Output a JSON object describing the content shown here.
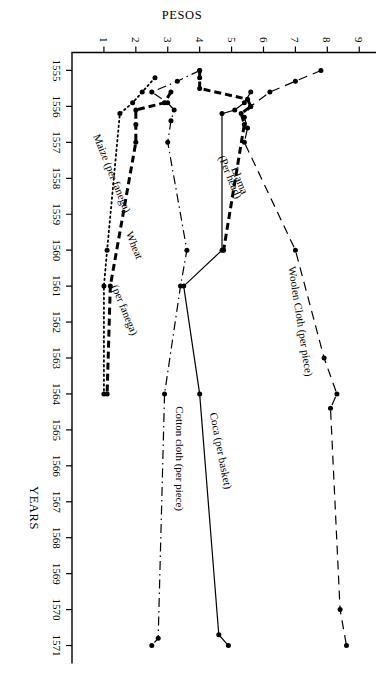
{
  "figure": {
    "x_axis_title": "YEARS",
    "y_axis_title": "PESOS",
    "rotation_note": "landscape plate printed rotated 90 degrees"
  },
  "chart_data": {
    "type": "line",
    "title": "",
    "subtitle": "",
    "xlabel": "YEARS",
    "ylabel": "PESOS",
    "xlim": [
      1554.5,
      1571.5
    ],
    "ylim": [
      0,
      9.4
    ],
    "grid": false,
    "legend": "inline-labels",
    "x_ticks": [
      1555,
      1556,
      1557,
      1558,
      1559,
      1560,
      1561,
      1562,
      1563,
      1564,
      1565,
      1566,
      1567,
      1568,
      1569,
      1570,
      1571
    ],
    "x_tick_labels": [
      "1555",
      "1556",
      "1557",
      "1558",
      "1559",
      "1560",
      "1561",
      "1562",
      "1563",
      "1564",
      "1565",
      "1566",
      "1567",
      "1568",
      "1569",
      "1570",
      "1571"
    ],
    "y_ticks": [
      1,
      2,
      3,
      4,
      5,
      6,
      7,
      8,
      9
    ],
    "y_tick_labels": [
      "1",
      "2",
      "3",
      "4",
      "5",
      "6",
      "7",
      "8",
      "9"
    ],
    "categories": [
      1555,
      1556,
      1557,
      1558,
      1559,
      1560,
      1561,
      1562,
      1563,
      1564,
      1565,
      1566,
      1567,
      1568,
      1569,
      1570,
      1571
    ],
    "series": [
      {
        "name": "Woolen Cloth (per piece)",
        "label": "Woolen Cloth (per piece)",
        "style": "longdash",
        "unit": "per piece",
        "x": [
          1555.0,
          1555.3,
          1555.6,
          1556.0,
          1556.3,
          1556.6,
          1557.0,
          1560.0,
          1563.0,
          1564.0,
          1564.4,
          1570.0,
          1571.0
        ],
        "values": [
          7.8,
          7.0,
          6.2,
          5.6,
          5.4,
          5.5,
          5.4,
          7.0,
          7.9,
          8.3,
          8.1,
          8.4,
          8.6
        ]
      },
      {
        "name": "Coca (per basket)",
        "label": "Coca (per basket)",
        "style": "solid",
        "unit": "per basket",
        "x": [
          1555.6,
          1555.9,
          1556.1,
          1556.2,
          1560.0,
          1561.0,
          1564.0,
          1570.7,
          1571.0
        ],
        "values": [
          5.6,
          5.4,
          5.1,
          4.7,
          4.7,
          3.5,
          4.0,
          4.6,
          4.9
        ]
      },
      {
        "name": "Cotton cloth (per piece)",
        "label": "Cotton cloth (per piece)",
        "style": "dashdot",
        "unit": "per piece",
        "x": [
          1555.0,
          1555.3,
          1555.6,
          1555.9,
          1556.1,
          1556.4,
          1557.0,
          1560.0,
          1561.0,
          1564.0,
          1570.8,
          1571.0
        ],
        "values": [
          4.0,
          3.3,
          2.5,
          3.0,
          3.2,
          3.1,
          3.0,
          3.6,
          3.4,
          2.9,
          2.7,
          2.5
        ]
      },
      {
        "name": "Llama (Per head)",
        "label": "Llama (Per head)",
        "style": "heavydash",
        "unit": "per head",
        "x": [
          1555.0,
          1555.2,
          1555.5,
          1555.8,
          1556.0,
          1556.2,
          1556.5,
          1560.0
        ],
        "values": [
          4.0,
          4.0,
          4.0,
          5.5,
          5.6,
          5.3,
          5.4,
          4.75
        ]
      },
      {
        "name": "Wheat (per fanega)",
        "label": "Wheat (per fanega)",
        "style": "heavydash",
        "unit": "per fanega",
        "x": [
          1555.6,
          1555.9,
          1556.1,
          1556.5,
          1557.0,
          1561.0,
          1564.0
        ],
        "values": [
          3.1,
          2.9,
          2.0,
          2.0,
          2.0,
          1.2,
          1.1
        ]
      },
      {
        "name": "Maize (per fanega)",
        "label": "Maize (per fanega)",
        "style": "dotted",
        "unit": "per fanega",
        "x": [
          1555.2,
          1555.6,
          1555.9,
          1556.2,
          1560.0,
          1561.0,
          1564.0
        ],
        "values": [
          2.6,
          2.2,
          1.9,
          1.5,
          1.1,
          1.0,
          1.0
        ]
      }
    ],
    "series_labels": [
      {
        "text": "Woolen Cloth (per piece)",
        "x": 1562.0,
        "y": 7.05,
        "rotate": -9
      },
      {
        "text": "Coca (per basket)",
        "x": 1565.6,
        "y": 4.55,
        "rotate": -11
      },
      {
        "text": "Cotton cloth (per piece)",
        "x": 1565.8,
        "y": 3.25,
        "rotate": 0
      },
      {
        "text": "Llama",
        "x": 1558.1,
        "y": 5.15,
        "rotate": -22
      },
      {
        "text": "(Per head)",
        "x": 1558.0,
        "y": 4.85,
        "rotate": -22
      },
      {
        "text": "Wheat",
        "x": 1559.9,
        "y": 1.85,
        "rotate": -22
      },
      {
        "text": "(per fanega)",
        "x": 1561.7,
        "y": 1.55,
        "rotate": -22
      },
      {
        "text": "Maize (per fanega)",
        "x": 1557.9,
        "y": 1.15,
        "rotate": -22
      }
    ]
  }
}
